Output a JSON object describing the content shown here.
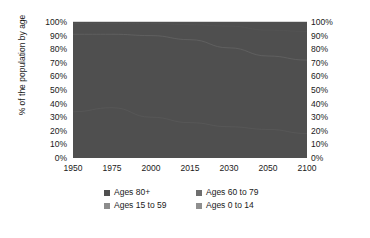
{
  "title_remnant": "",
  "axes": {
    "ylabel": "% of the population by age",
    "yticks": [
      "100%",
      "90%",
      "80%",
      "70%",
      "60%",
      "50%",
      "40%",
      "30%",
      "20%",
      "10%",
      "0%"
    ],
    "xticks": [
      "1950",
      "1975",
      "2000",
      "2015",
      "2030",
      "2050",
      "2100"
    ]
  },
  "legend": {
    "items": [
      {
        "label": "Ages 80+",
        "color": "#4f4f4f"
      },
      {
        "label": "Ages 60 to 79",
        "color": "#6e6e6e"
      },
      {
        "label": "Ages 15 to 59",
        "color": "#8c8c8c"
      },
      {
        "label": "Ages 0 to 14",
        "color": "#8f8f8f"
      }
    ]
  },
  "colors": {
    "ages_80_plus": "#4f4f4f",
    "ages_60_79": "#6e6e6e",
    "ages_15_59": "#8c8c8c",
    "ages_0_14": "#8f8f8f",
    "hairline": "#7a7a7a",
    "plot_border": "#d8d8d8",
    "text": "#1a1a1a",
    "background": "#ffffff"
  },
  "chart_data": {
    "type": "area",
    "stacked": true,
    "normalized": true,
    "title": "",
    "xlabel": "",
    "ylabel": "% of the population by age",
    "ylim": [
      0,
      100
    ],
    "xlim": [
      1950,
      2100
    ],
    "grid": false,
    "legend_position": "bottom",
    "x": [
      1950,
      1975,
      2000,
      2015,
      2030,
      2050,
      2100
    ],
    "x_positions": [
      0,
      16.67,
      33.33,
      50,
      66.67,
      83.33,
      100
    ],
    "series": [
      {
        "name": "Ages 0 to 14",
        "values": [
          34,
          37,
          30,
          26,
          23,
          21,
          18
        ],
        "cumulative_top": [
          34,
          37,
          30,
          26,
          23,
          21,
          18
        ]
      },
      {
        "name": "Ages 15 to 59",
        "values": [
          57,
          54,
          60,
          61,
          58,
          54,
          54
        ],
        "cumulative_top": [
          91,
          91,
          90,
          87,
          81,
          75,
          72
        ]
      },
      {
        "name": "Ages 60 to 79",
        "values": [
          8,
          8,
          9,
          11,
          16,
          19,
          21
        ],
        "cumulative_top": [
          99,
          99,
          99,
          98,
          97,
          94,
          93
        ]
      },
      {
        "name": "Ages 80+",
        "values": [
          1,
          1,
          1,
          2,
          3,
          6,
          7
        ],
        "cumulative_top": [
          100,
          100,
          100,
          100,
          100,
          100,
          100
        ]
      }
    ]
  }
}
